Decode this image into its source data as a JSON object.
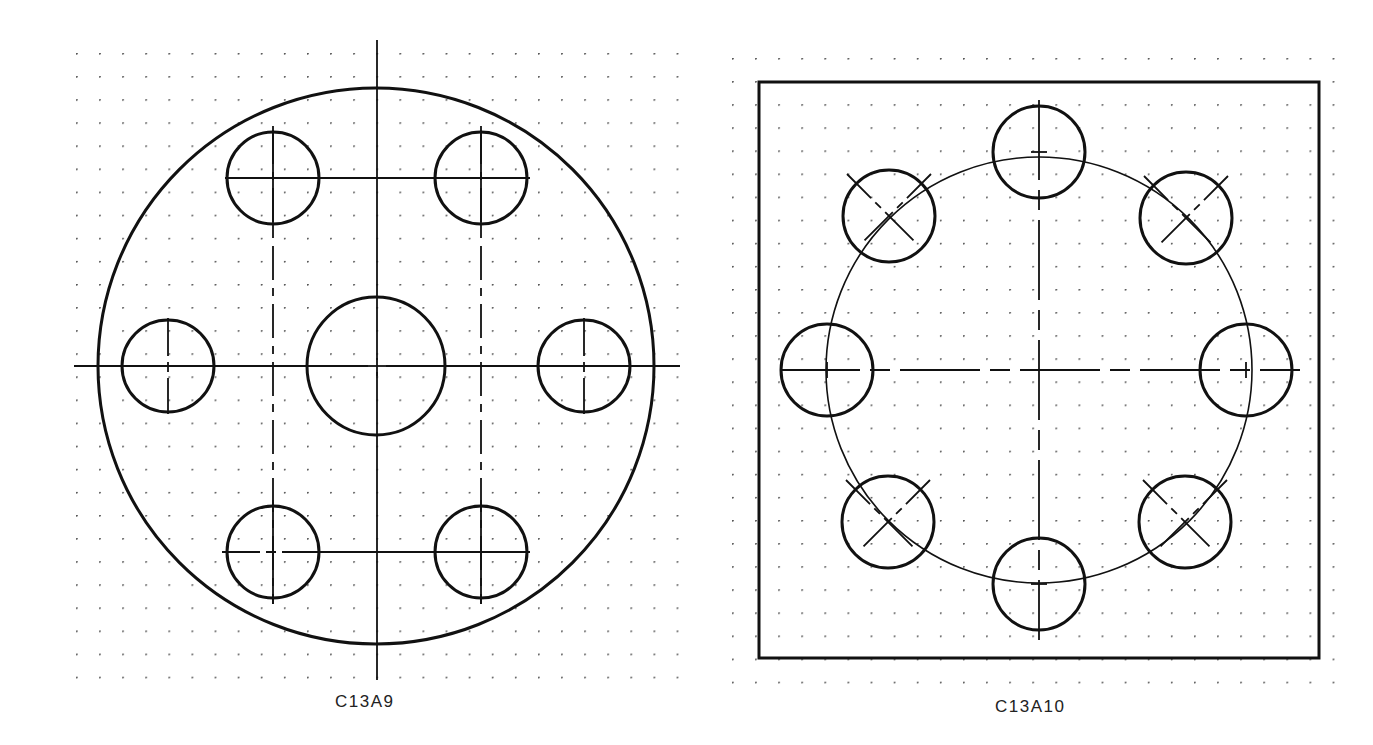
{
  "figures": [
    {
      "id": "C13A9",
      "label": "C13A9",
      "outline": "circle",
      "description": "Large circular plate with central large hole, two side holes on horizontal centerline, and four holes in a rectangular pattern",
      "holes": [
        {
          "position": "center",
          "size": "large"
        },
        {
          "position": "left",
          "size": "small"
        },
        {
          "position": "right",
          "size": "small"
        },
        {
          "position": "top-left",
          "size": "small"
        },
        {
          "position": "top-right",
          "size": "small"
        },
        {
          "position": "bottom-left",
          "size": "small"
        },
        {
          "position": "bottom-right",
          "size": "small"
        }
      ]
    },
    {
      "id": "C13A10",
      "label": "C13A10",
      "outline": "square",
      "description": "Square plate with eight holes equally spaced on a bolt circle",
      "holes_on_bolt_circle": 8
    }
  ],
  "colors": {
    "line": "#111111",
    "grid_dot": "#555555",
    "background": "#ffffff"
  }
}
